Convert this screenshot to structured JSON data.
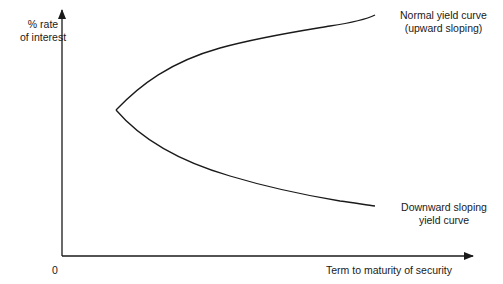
{
  "figure": {
    "type": "diagram",
    "colors": {
      "background": "#ffffff",
      "line": "#1a1a1a",
      "text": "#1a1a1a"
    }
  },
  "axes": {
    "y_label_line1": "% rate",
    "y_label_line2": "of interest",
    "x_label": "Term to maturity of security",
    "origin_label": "0"
  },
  "curves": [
    {
      "name": "normal-yield-curve",
      "label_line1": "Normal yield curve",
      "label_line2": "(upward sloping)",
      "direction": "upward"
    },
    {
      "name": "downward-sloping-yield-curve",
      "label_line1": "Downward sloping",
      "label_line2": "yield curve",
      "direction": "downward"
    }
  ]
}
